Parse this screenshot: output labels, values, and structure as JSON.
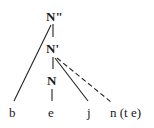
{
  "tree": {
    "nodes": {
      "root": "N\"",
      "bar": "N'",
      "head": "N"
    },
    "leaves": {
      "b": "b",
      "e": "e",
      "j": "j",
      "n": "n (t e)"
    },
    "edges": [
      {
        "from": "N\"",
        "to": "N'",
        "style": "solid"
      },
      {
        "from": "N\"",
        "to": "b",
        "style": "solid"
      },
      {
        "from": "N'",
        "to": "N",
        "style": "solid"
      },
      {
        "from": "N'",
        "to": "j",
        "style": "solid"
      },
      {
        "from": "N'",
        "to": "n (t e)",
        "style": "dashed"
      },
      {
        "from": "N",
        "to": "e",
        "style": "solid"
      }
    ]
  }
}
